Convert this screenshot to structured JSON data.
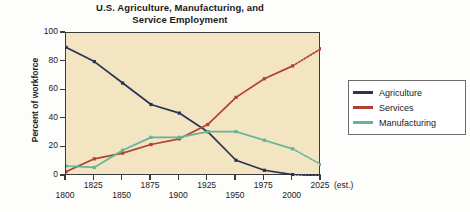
{
  "chart_data": {
    "type": "line",
    "title": "U.S. Agriculture, Manufacturing, and Service Employment",
    "title_line1": "U.S. Agriculture, Manufacturing, and",
    "title_line2": "Service Employment",
    "xlabel": "",
    "ylabel": "Percent of workforce",
    "x": [
      1800,
      1825,
      1850,
      1875,
      1900,
      1925,
      1950,
      1975,
      2000,
      2025
    ],
    "xtick_labels": [
      "1800",
      "1825",
      "1850",
      "1875",
      "1900",
      "1925",
      "1950",
      "1975",
      "2000",
      "2025"
    ],
    "x_last_note": "(est.)",
    "ytick_labels": [
      "0",
      "20",
      "40",
      "60",
      "80",
      "100"
    ],
    "ytick_values": [
      0,
      20,
      40,
      60,
      80,
      100
    ],
    "ylim": [
      0,
      100
    ],
    "xlim": [
      1800,
      2025
    ],
    "grid": false,
    "legend_position": "right",
    "plot_background": "#f3e4c2",
    "series": [
      {
        "name": "Agriculture",
        "color": "#2a3356",
        "values": [
          90,
          80,
          65,
          50,
          44,
          31,
          11,
          4,
          1,
          0
        ],
        "dashed_from_index": 8
      },
      {
        "name": "Services",
        "color": "#b4412f",
        "values": [
          3,
          12,
          16,
          22,
          26,
          36,
          55,
          68,
          77,
          89
        ],
        "dashed_from_index": 8
      },
      {
        "name": "Manufacturing",
        "color": "#63b49c",
        "values": [
          7,
          6,
          18,
          27,
          27,
          31,
          31,
          25,
          19,
          8
        ],
        "dashed_from_index": 8
      }
    ]
  },
  "legend": {
    "items": [
      {
        "label": "Agriculture",
        "color": "#2a3356"
      },
      {
        "label": "Services",
        "color": "#b4412f"
      },
      {
        "label": "Manufacturing",
        "color": "#63b49c"
      }
    ]
  }
}
